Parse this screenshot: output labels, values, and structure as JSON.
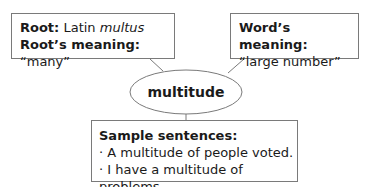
{
  "center_word": "multitude",
  "root_box": {
    "root_label": "Root:",
    "root_value_prefix": "Latin",
    "root_value_word": "multus",
    "meaning_label": "Root’s meaning:",
    "meaning_value": "“many”"
  },
  "word_meaning_box": {
    "label": "Word’s meaning:",
    "value": "“large number”"
  },
  "sentences_box": {
    "label": "Sample sentences:",
    "items": [
      "· A multitude of people voted.",
      "· I have a multitude of problems."
    ]
  },
  "colors": {
    "stroke": "#7a7a7a",
    "text": "#1a1a1a",
    "background": "#ffffff"
  }
}
